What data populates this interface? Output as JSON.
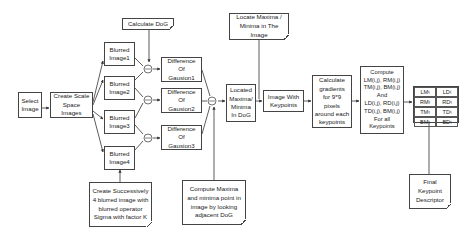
{
  "diagram": {
    "nodes": {
      "select_image": "Select\nImage",
      "create_scale_space": "Create Scale\nSpace Images",
      "blurred": [
        "Blurred\nImage1",
        "Blurred\nImage2",
        "Blurred\nImage3",
        "Blurred\nImage4"
      ],
      "calculate_dog": "Calculate DoG",
      "dog": [
        "Difference\nOf\nGausion1",
        "Difference\nOf\nGausion2",
        "Difference\nOf\nGausion3"
      ],
      "located_maxima": "Located\nMaxima/\nMinima\nIn DoG",
      "locate_maxima_note": "Locate Maxima /\nMinima in The Image",
      "image_with_keypoints": "Image With\nKeypoints",
      "calculate_gradients": "Calculate\ngradients\nfor 9*9\npixels\naround each\nkeypoints",
      "compute_descriptor": "Compute\nLM(i,j), RM(i,j)\nTM(i,j), BM(i,j)\nAnd\nLD(i,j), RD(i,j)\nTD(i,j), BM(i,j)\nFor all\nKeypoints",
      "successive_blur_note": "Create Successively\n4 blurred image with\nblurred operator\nSigma with factor K",
      "compute_maxima_note": "Compute Maxima\nand minima point in\nimage by looking\nadjacent DoG",
      "final_descriptor_note": "Final\nKeypoint\nDescriptor"
    },
    "operator_symbol": "⊖",
    "descriptor_table": [
      [
        "LM",
        "ij",
        "LD",
        "ij"
      ],
      [
        "RM",
        "ij",
        "RD",
        "ij"
      ],
      [
        "TM",
        "ij",
        "TD",
        "ij"
      ],
      [
        "BM",
        "ij",
        "BD",
        "ij"
      ]
    ]
  }
}
